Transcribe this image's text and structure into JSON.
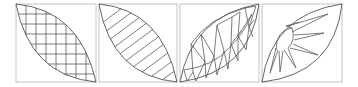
{
  "figure": {
    "line_color": "#555555",
    "frame_color": "#c4c4c4",
    "background": "#ffffff",
    "panels": [
      {
        "id": "panel-1",
        "pattern": "crosshatch-grid",
        "frame": {
          "x": 16,
          "y": 4,
          "w": 80,
          "h": 78
        },
        "lens_direction": "top-left-to-bottom-right",
        "grid_spacing": 10
      },
      {
        "id": "panel-2",
        "pattern": "diagonal-stripes",
        "frame": {
          "x": 99,
          "y": 4,
          "w": 78,
          "h": 78
        },
        "lens_direction": "top-left-to-bottom-right",
        "stripe_count": 9
      },
      {
        "id": "panel-3",
        "pattern": "triangulated-lens",
        "frame": {
          "x": 180,
          "y": 4,
          "w": 79,
          "h": 78
        },
        "lens_direction": "bottom-left-to-top-right"
      },
      {
        "id": "panel-4",
        "pattern": "sunburst",
        "frame": {
          "x": 262,
          "y": 4,
          "w": 80,
          "h": 78
        },
        "lens_direction": "bottom-left-to-top-right",
        "ray_count": 7
      }
    ]
  }
}
